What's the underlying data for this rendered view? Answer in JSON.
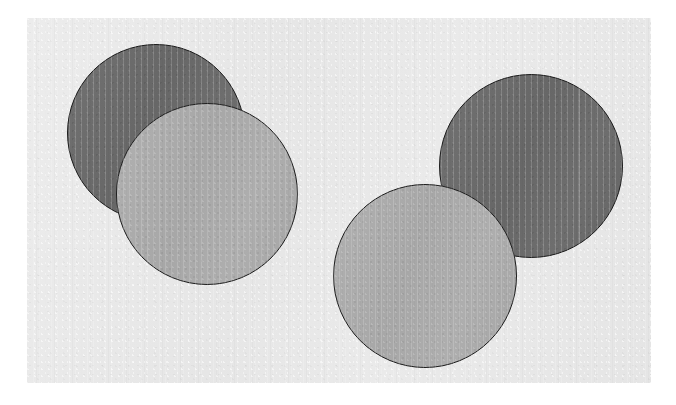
{
  "figure": {
    "width": 676,
    "height": 405,
    "page_background": "#ffffff",
    "plate": {
      "name": "image-plate",
      "x": 27,
      "y": 18,
      "width": 624,
      "height": 365,
      "fill": "#e9e9e9"
    },
    "palette": {
      "dark_disc_fill": "#6b6b6b",
      "light_disc_fill": "#ababab",
      "outline": "#1d1d1d",
      "plate_fill": "#e9e9e9",
      "page_white": "#ffffff"
    },
    "groups": [
      {
        "name": "left-pair",
        "discs": [
          {
            "name": "disc-left-dark",
            "tone": "dark",
            "z": 1,
            "cx": 156,
            "cy": 133,
            "r": 89,
            "fill": "#6b6b6b",
            "streak": null
          },
          {
            "name": "disc-left-light",
            "tone": "light",
            "z": 2,
            "cx": 207,
            "cy": 194,
            "r": 91,
            "fill": "#ababab",
            "streak": null
          }
        ]
      },
      {
        "name": "right-pair",
        "discs": [
          {
            "name": "disc-right-dark",
            "tone": "dark",
            "z": 1,
            "cx": 531,
            "cy": 166,
            "r": 92,
            "fill": "#6b6b6b",
            "streak": 0.76
          },
          {
            "name": "disc-right-light",
            "tone": "light",
            "z": 2,
            "cx": 425,
            "cy": 276,
            "r": 92,
            "fill": "#ababab",
            "streak": null
          }
        ]
      }
    ]
  }
}
